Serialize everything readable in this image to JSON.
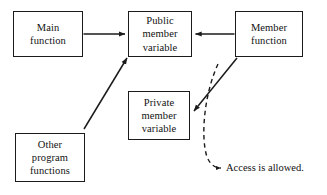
{
  "diagram": {
    "type": "node-edge-diagram",
    "background_color": "#ffffff",
    "stroke_color": "#1b1b1b",
    "text_color": "#111111",
    "nodes": [
      {
        "id": "main-function",
        "lines": [
          "Main",
          "function"
        ],
        "line1": "Main",
        "line2": "function",
        "line3": ""
      },
      {
        "id": "public-member-variable",
        "lines": [
          "Public",
          "member",
          "variable"
        ],
        "line1": "Public",
        "line2": "member",
        "line3": "variable"
      },
      {
        "id": "member-function",
        "lines": [
          "Member",
          "function"
        ],
        "line1": "Member",
        "line2": "function",
        "line3": ""
      },
      {
        "id": "private-member-variable",
        "lines": [
          "Private",
          "member",
          "variable"
        ],
        "line1": "Private",
        "line2": "member",
        "line3": "variable"
      },
      {
        "id": "other-program-functions",
        "lines": [
          "Other",
          "program",
          "functions"
        ],
        "line1": "Other",
        "line2": "program",
        "line3": "functions"
      }
    ],
    "edges": [
      {
        "id": "main-to-public",
        "from": "main-function",
        "to": "public-member-variable",
        "style": "solid",
        "arrow": "end"
      },
      {
        "id": "member-fn-to-public",
        "from": "member-function",
        "to": "public-member-variable",
        "style": "solid",
        "arrow": "end"
      },
      {
        "id": "other-to-public",
        "from": "other-program-functions",
        "to": "public-member-variable",
        "style": "solid",
        "arrow": "end"
      },
      {
        "id": "member-fn-to-private",
        "from": "member-function",
        "to": "private-member-variable",
        "style": "solid",
        "arrow": "end"
      },
      {
        "id": "access-annotation-leader",
        "from": "member-fn-to-private",
        "to": "access-caption",
        "style": "dashed",
        "arrow": "end"
      }
    ],
    "annotations": [
      {
        "id": "access-caption",
        "text": "Access is allowed."
      }
    ]
  }
}
